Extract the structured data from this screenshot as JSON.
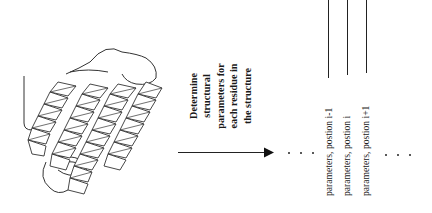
{
  "figure": {
    "type": "flow-diagram",
    "orientation": "rotated-90-ccw-text",
    "left_graphic": {
      "label": "protein-helix-bundle-ribbon",
      "description": "Ribbon cartoon of a four-helix bundle protein structure"
    },
    "step": {
      "lines": [
        "Determine",
        "structural",
        "parameters for",
        "each residue in",
        "the structure"
      ]
    },
    "arrow": {
      "direction": "right"
    },
    "ellipsis_after_arrow": "· · ·",
    "outputs": [
      {
        "label": "parameters, postion i-1"
      },
      {
        "label": "parameters, postion i"
      },
      {
        "label": "parameters, postion i+1"
      }
    ],
    "ellipsis_after_outputs": "· · ·",
    "colors": {
      "line": "#222222",
      "text": "#1a1a1a",
      "background": "#ffffff"
    }
  }
}
